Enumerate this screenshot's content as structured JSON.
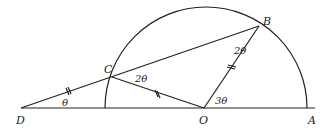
{
  "diagram": {
    "type": "geometry",
    "points": {
      "D": {
        "label": "D",
        "x": 21,
        "y": 108
      },
      "O": {
        "label": "O",
        "x": 204,
        "y": 108
      },
      "A": {
        "label": "A",
        "x": 307,
        "y": 108
      },
      "C": {
        "label": "C",
        "x": 112,
        "y": 77
      },
      "B": {
        "label": "B",
        "x": 259,
        "y": 26
      }
    },
    "angles": {
      "D": "θ",
      "C": "2θ",
      "B": "2θ",
      "O": "3θ"
    },
    "equal_segments": [
      "DC",
      "CO",
      "OB"
    ],
    "colors": {
      "stroke": "#222222",
      "background": "#ffffff"
    }
  }
}
